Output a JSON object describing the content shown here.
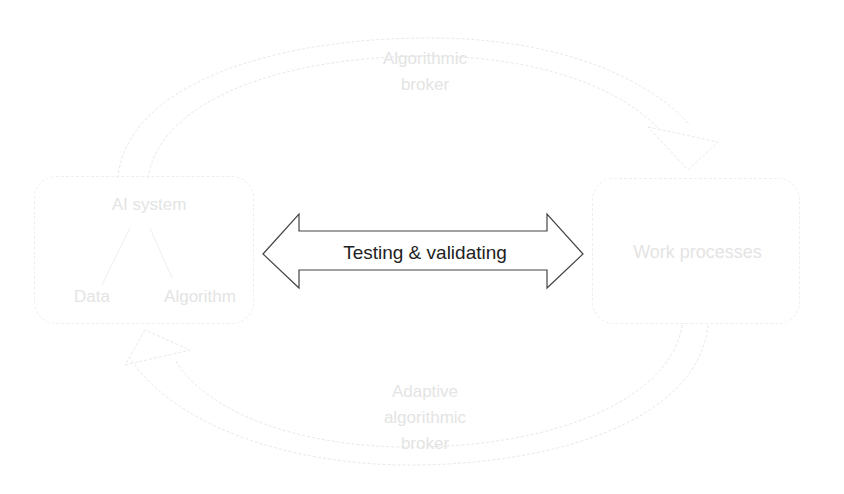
{
  "diagram": {
    "left_box": {
      "title": "AI system",
      "children": [
        "Data",
        "Algorithm"
      ]
    },
    "right_box": {
      "title": "Work processes"
    },
    "center_arrow": {
      "label": "Testing & validating",
      "direction": "bidirectional"
    },
    "top_arc": {
      "label_line1": "Algorithmic",
      "label_line2": "broker",
      "direction": "AI system → Work processes"
    },
    "bottom_arc": {
      "label_line1": "Adaptive",
      "label_line2": "algorithmic",
      "label_line3": "broker",
      "direction": "Work processes → AI system"
    },
    "colors": {
      "background": "#ffffff",
      "faint_element": "#e6e6e6",
      "center_arrow_stroke": "#333333",
      "center_text": "#222222"
    }
  }
}
